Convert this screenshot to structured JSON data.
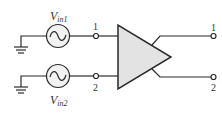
{
  "diagram": {
    "type": "differential amplifier circuit",
    "colors": {
      "stroke": "#2a2a2a",
      "amp_fill": "#e3e3e3",
      "source_fill": "#f2f2f2"
    },
    "sources": [
      {
        "label_main": "V",
        "label_sub": "in1",
        "terminal": "1"
      },
      {
        "label_main": "V",
        "label_sub": "in2",
        "terminal": "2"
      }
    ],
    "outputs": [
      {
        "terminal": "1"
      },
      {
        "terminal": "2"
      }
    ]
  }
}
